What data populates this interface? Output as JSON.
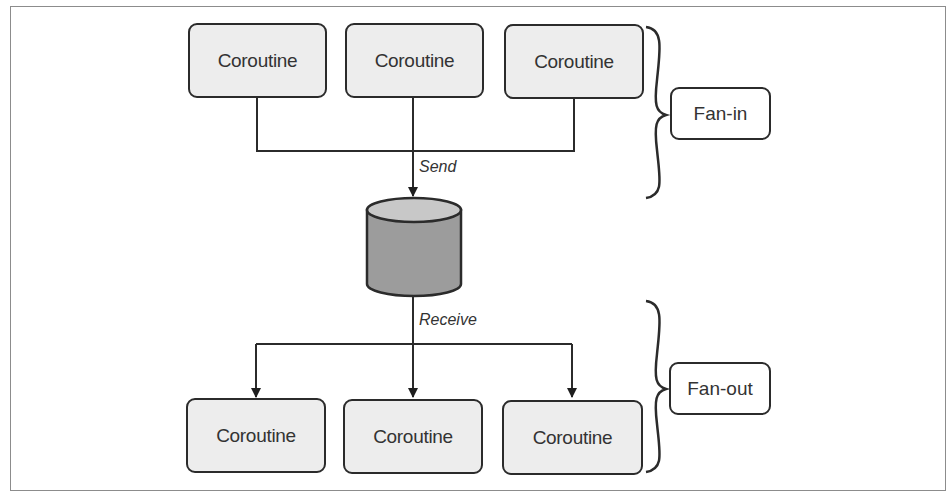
{
  "diagram": {
    "producers": [
      {
        "label": "Coroutine"
      },
      {
        "label": "Coroutine"
      },
      {
        "label": "Coroutine"
      }
    ],
    "consumers": [
      {
        "label": "Coroutine"
      },
      {
        "label": "Coroutine"
      },
      {
        "label": "Coroutine"
      }
    ],
    "channel": {
      "shape": "cylinder",
      "top_color": "#c8c8c8",
      "body_color": "#9c9c9c"
    },
    "edges": {
      "send_label": "Send",
      "receive_label": "Receive"
    },
    "groups": {
      "fan_in_label": "Fan-in",
      "fan_out_label": "Fan-out"
    },
    "colors": {
      "node_fill": "#ededed",
      "stroke": "#2b2b2b",
      "text": "#333333"
    }
  }
}
